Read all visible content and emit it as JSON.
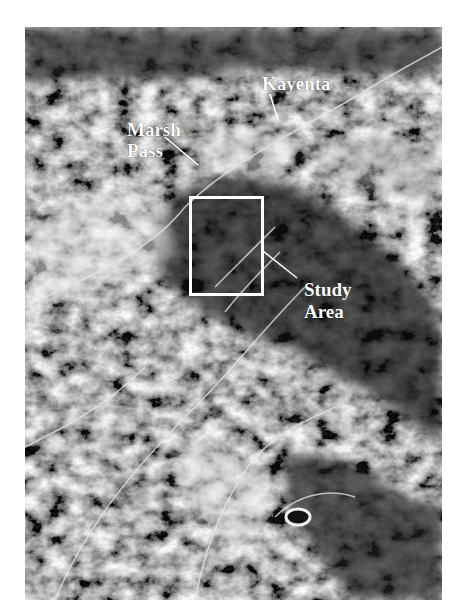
{
  "figure": {
    "type": "satellite-image-map",
    "colormode": "grayscale"
  },
  "labels": {
    "kayenta": "Kayenta",
    "marsh_pass_line1": "Marsh",
    "marsh_pass_line2": "Pass",
    "study_area_line1": "Study",
    "study_area_line2": "Area"
  },
  "study_area_box": {
    "x": 189,
    "y": 196,
    "width": 75,
    "height": 100,
    "color": "#ffffff"
  },
  "colors": {
    "background": "#ffffff",
    "label": "#ffffff",
    "terrain_dark": "#1e1e1e",
    "terrain_mid": "#6a6a6a",
    "terrain_light": "#d8d8d8"
  }
}
